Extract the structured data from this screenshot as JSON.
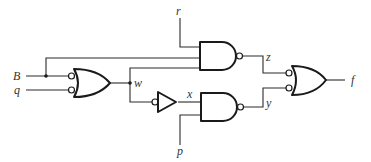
{
  "diagram": {
    "type": "logic-circuit",
    "colors": {
      "line": "#1a1a1a",
      "label": "#333333",
      "background": "#ffffff"
    },
    "inputs": [
      {
        "id": "B",
        "label": "B"
      },
      {
        "id": "q",
        "label": "q"
      },
      {
        "id": "r",
        "label": "r"
      },
      {
        "id": "p",
        "label": "p"
      }
    ],
    "signals": [
      {
        "id": "w",
        "label": "w"
      },
      {
        "id": "x",
        "label": "x"
      },
      {
        "id": "z",
        "label": "z"
      },
      {
        "id": "y",
        "label": "y"
      }
    ],
    "output": {
      "id": "f",
      "label": "f"
    },
    "gates": [
      {
        "id": "or1",
        "kind": "OR",
        "inverted_inputs": true,
        "inputs": [
          "B",
          "q"
        ],
        "output": "w"
      },
      {
        "id": "inv1",
        "kind": "BUFFER",
        "inverted_input": true,
        "inputs": [
          "w"
        ],
        "output": "x"
      },
      {
        "id": "nand_top",
        "kind": "NAND",
        "inputs": [
          "r",
          "B",
          "w"
        ],
        "output": "z"
      },
      {
        "id": "nand_bottom",
        "kind": "NAND",
        "inputs": [
          "x",
          "p"
        ],
        "output": "y"
      },
      {
        "id": "or2",
        "kind": "OR",
        "inverted_inputs": true,
        "inputs": [
          "z",
          "y"
        ],
        "output": "f"
      }
    ]
  }
}
